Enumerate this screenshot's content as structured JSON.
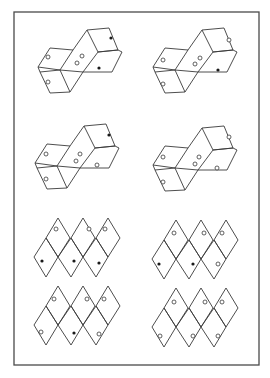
{
  "colors": {
    "line": "#3a3a3a",
    "frame": "#4a4a4a",
    "background": "#ffffff",
    "solid_dot": "#1a1a1a"
  },
  "figures": [
    {
      "id": "cube-figure-1",
      "row": 1,
      "col": "left",
      "type": "cube-stack",
      "markers": [
        {
          "face": "left-upper",
          "kind": "open"
        },
        {
          "face": "left-lower",
          "kind": "open"
        },
        {
          "face": "center-upper",
          "kind": "open"
        },
        {
          "face": "center-lower",
          "kind": "open"
        },
        {
          "face": "top-right",
          "kind": "solid"
        },
        {
          "face": "lower-right",
          "kind": "solid"
        }
      ]
    },
    {
      "id": "cube-figure-2",
      "row": 1,
      "col": "right",
      "type": "cube-stack",
      "markers": [
        {
          "face": "left-upper",
          "kind": "open"
        },
        {
          "face": "left-lower",
          "kind": "open"
        },
        {
          "face": "center-upper",
          "kind": "open"
        },
        {
          "face": "center-lower",
          "kind": "open"
        },
        {
          "face": "top-right",
          "kind": "open"
        },
        {
          "face": "lower-right",
          "kind": "solid"
        }
      ]
    },
    {
      "id": "cube-figure-3",
      "row": 2,
      "col": "left",
      "type": "cube-stack",
      "markers": [
        {
          "face": "left-upper",
          "kind": "open"
        },
        {
          "face": "left-lower",
          "kind": "open"
        },
        {
          "face": "center-upper",
          "kind": "open"
        },
        {
          "face": "center-lower",
          "kind": "open"
        },
        {
          "face": "top-right",
          "kind": "solid"
        },
        {
          "face": "lower-right",
          "kind": "open"
        }
      ]
    },
    {
      "id": "cube-figure-4",
      "row": 2,
      "col": "right",
      "type": "cube-stack",
      "markers": [
        {
          "face": "left-upper",
          "kind": "open"
        },
        {
          "face": "left-lower",
          "kind": "open"
        },
        {
          "face": "center-upper",
          "kind": "open"
        },
        {
          "face": "center-lower",
          "kind": "open"
        },
        {
          "face": "top-right",
          "kind": "open"
        },
        {
          "face": "lower-right",
          "kind": "open"
        }
      ]
    },
    {
      "id": "rhombus-net-1",
      "row": 3,
      "col": "left",
      "type": "rhombus-net",
      "markers": [
        {
          "cell": "top-1",
          "kind": "open"
        },
        {
          "cell": "top-2",
          "kind": "open"
        },
        {
          "cell": "top-3",
          "kind": "open"
        },
        {
          "cell": "bottom-1",
          "kind": "solid"
        },
        {
          "cell": "bottom-2",
          "kind": "solid"
        },
        {
          "cell": "bottom-3",
          "kind": "solid"
        }
      ]
    },
    {
      "id": "rhombus-net-2",
      "row": 3,
      "col": "right",
      "type": "rhombus-net",
      "markers": [
        {
          "cell": "top-1",
          "kind": "open"
        },
        {
          "cell": "top-2",
          "kind": "open"
        },
        {
          "cell": "top-3",
          "kind": "open"
        },
        {
          "cell": "bottom-1",
          "kind": "solid"
        },
        {
          "cell": "bottom-2",
          "kind": "solid"
        },
        {
          "cell": "bottom-3",
          "kind": "open"
        }
      ]
    },
    {
      "id": "rhombus-net-3",
      "row": 4,
      "col": "left",
      "type": "rhombus-net",
      "markers": [
        {
          "cell": "top-1",
          "kind": "open"
        },
        {
          "cell": "top-2",
          "kind": "open"
        },
        {
          "cell": "top-3",
          "kind": "open"
        },
        {
          "cell": "bottom-1",
          "kind": "open"
        },
        {
          "cell": "bottom-2",
          "kind": "solid"
        },
        {
          "cell": "bottom-3",
          "kind": "open"
        }
      ]
    },
    {
      "id": "rhombus-net-4",
      "row": 4,
      "col": "right",
      "type": "rhombus-net",
      "markers": [
        {
          "cell": "top-1",
          "kind": "open"
        },
        {
          "cell": "top-2",
          "kind": "open"
        },
        {
          "cell": "top-3",
          "kind": "open"
        },
        {
          "cell": "bottom-1",
          "kind": "open"
        },
        {
          "cell": "bottom-2",
          "kind": "open"
        },
        {
          "cell": "bottom-3",
          "kind": "open"
        }
      ]
    }
  ]
}
